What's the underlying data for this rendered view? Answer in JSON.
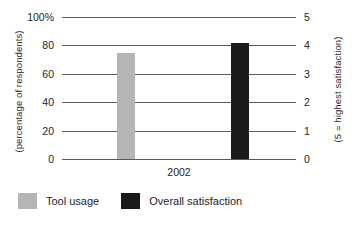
{
  "chart_data": {
    "type": "bar",
    "title": "",
    "subtitle": "",
    "categories": [
      "2002"
    ],
    "xlabel": "",
    "grid": true,
    "legend_position": "bottom",
    "series": [
      {
        "name": "Tool usage",
        "axis": "left",
        "color": "#b5b5b5",
        "values": [
          75
        ],
        "unit": "%"
      },
      {
        "name": "Overall satisfaction",
        "axis": "right",
        "color": "#1a1a1a",
        "values": [
          4.1
        ],
        "unit": "rating"
      }
    ],
    "axes": {
      "left": {
        "label": "(percentage of respondents)",
        "ylim": [
          0,
          100
        ],
        "ticks": [
          100,
          80,
          60,
          40,
          20,
          0
        ],
        "tick_labels": [
          "100%",
          "80",
          "60",
          "40",
          "20",
          "0"
        ]
      },
      "right": {
        "label": "(5 = highest satisfaction)",
        "ylim": [
          0,
          5
        ],
        "ticks": [
          5,
          4,
          3,
          2,
          1,
          0
        ],
        "tick_labels": [
          "5",
          "4",
          "3",
          "2",
          "1",
          "0"
        ]
      }
    }
  },
  "legend": {
    "items": [
      {
        "label": "Tool usage",
        "color": "#b5b5b5"
      },
      {
        "label": "Overall satisfaction",
        "color": "#1a1a1a"
      }
    ]
  },
  "colors": {
    "tool_usage": "#b5b5b5",
    "overall_satisfaction": "#1a1a1a",
    "gridline": "#5a5a5a",
    "text": "#1e1e1e",
    "background": "#ffffff"
  }
}
